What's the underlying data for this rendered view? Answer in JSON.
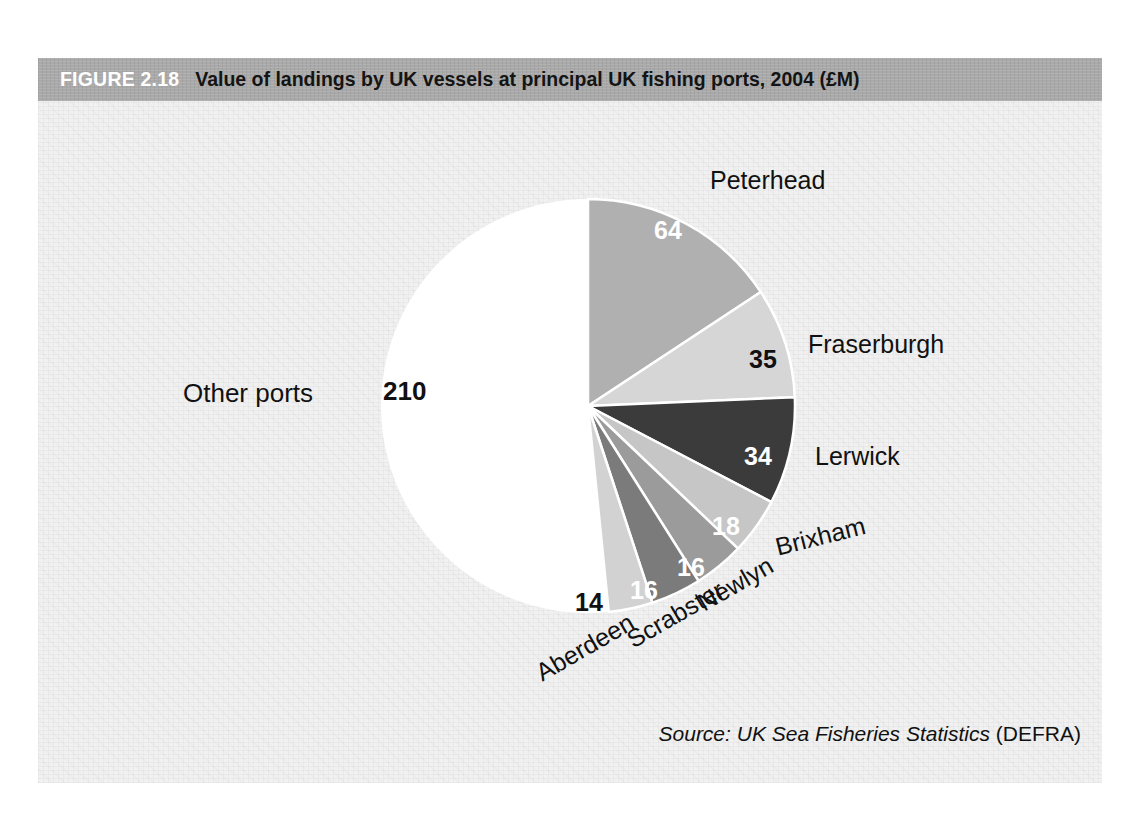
{
  "figure": {
    "number_label": "FIGURE 2.18",
    "title": "Value of landings by UK vessels at principal UK fishing ports, 2004 (£M)",
    "banner_color": "#a9a9a9",
    "panel_color": "#f1f1f1"
  },
  "source": {
    "italic_text": "Source: UK Sea Fisheries Statistics",
    "roman_text": "(DEFRA)"
  },
  "labels": {
    "peterhead": "Peterhead",
    "fraserburgh": "Fraserburgh",
    "lerwick": "Lerwick",
    "brixham": "Brixham",
    "newlyn": "Newlyn",
    "scrabster": "Scrabster",
    "aberdeen": "Aberdeen",
    "other_ports": "Other ports"
  },
  "values": {
    "peterhead": "64",
    "fraserburgh": "35",
    "lerwick": "34",
    "brixham": "18",
    "newlyn": "16",
    "scrabster": "16",
    "aberdeen": "14",
    "other_ports": "210"
  },
  "chart_data": {
    "type": "pie",
    "title": "Value of landings by UK vessels at principal UK fishing ports, 2004 (£M)",
    "unit": "£M",
    "xlabel": "",
    "ylabel": "",
    "grid": false,
    "legend": "none",
    "labels_position": "outside-with-inside-values",
    "start_angle_deg": 0,
    "direction": "clockwise",
    "total": 407,
    "categories": [
      "Peterhead",
      "Fraserburgh",
      "Lerwick",
      "Brixham",
      "Newlyn",
      "Scrabster",
      "Aberdeen",
      "Other ports"
    ],
    "values": [
      64,
      35,
      34,
      18,
      16,
      16,
      14,
      210
    ],
    "colors": [
      "#b0b0b0",
      "#d6d6d6",
      "#3b3b3b",
      "#c6c6c6",
      "#9b9b9b",
      "#7b7b7b",
      "#d2d2d2",
      "#ffffff"
    ],
    "slices": [
      {
        "name": "Peterhead",
        "value": 64,
        "color": "#b0b0b0",
        "label_color": "#ffffff",
        "angle_deg": 56.6,
        "percent": 15.7
      },
      {
        "name": "Fraserburgh",
        "value": 35,
        "color": "#d6d6d6",
        "label_color": "#111111",
        "angle_deg": 31.0,
        "percent": 8.6
      },
      {
        "name": "Lerwick",
        "value": 34,
        "color": "#3b3b3b",
        "label_color": "#ffffff",
        "angle_deg": 30.1,
        "percent": 8.4
      },
      {
        "name": "Brixham",
        "value": 18,
        "color": "#c6c6c6",
        "label_color": "#ffffff",
        "angle_deg": 15.9,
        "percent": 4.4
      },
      {
        "name": "Newlyn",
        "value": 16,
        "color": "#9b9b9b",
        "label_color": "#ffffff",
        "angle_deg": 14.2,
        "percent": 3.9
      },
      {
        "name": "Scrabster",
        "value": 16,
        "color": "#7b7b7b",
        "label_color": "#ffffff",
        "angle_deg": 14.2,
        "percent": 3.9
      },
      {
        "name": "Aberdeen",
        "value": 14,
        "color": "#d2d2d2",
        "label_color": "#111111",
        "angle_deg": 12.4,
        "percent": 3.4
      },
      {
        "name": "Other ports",
        "value": 210,
        "color": "#ffffff",
        "label_color": "#111111",
        "angle_deg": 185.8,
        "percent": 51.6
      }
    ]
  }
}
